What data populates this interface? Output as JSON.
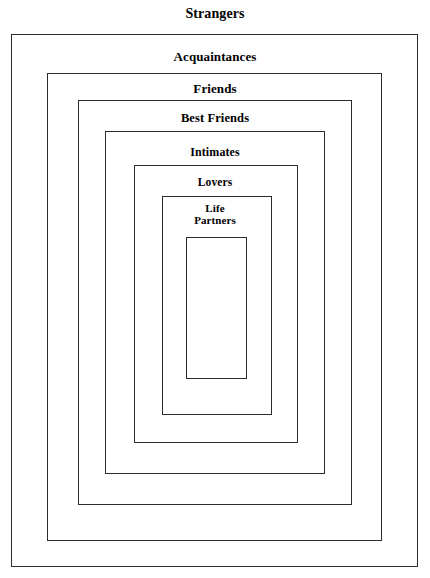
{
  "diagram": {
    "type": "nested-rectangles",
    "title": "Strangers",
    "rings": [
      {
        "label": "Strangers",
        "level": 1,
        "label_position": "above-outside",
        "geometry": {
          "left": 11,
          "top": 34,
          "right": 418,
          "bottom": 567
        },
        "label_top": 6,
        "font_size": 14
      },
      {
        "label": "Acquaintances",
        "level": 2,
        "label_position": "inside-top",
        "geometry": {
          "left": 47,
          "top": 73,
          "right": 382,
          "bottom": 541
        },
        "label_top": 50,
        "font_size": 13
      },
      {
        "label": "Friends",
        "level": 3,
        "label_position": "inside-top",
        "geometry": {
          "left": 78,
          "top": 100,
          "right": 352,
          "bottom": 505
        },
        "label_top": 82,
        "font_size": 13
      },
      {
        "label": "Best Friends",
        "level": 4,
        "label_position": "inside-top",
        "geometry": {
          "left": 105,
          "top": 131,
          "right": 325,
          "bottom": 474
        },
        "label_top": 112,
        "font_size": 12.5
      },
      {
        "label": "Intimates",
        "level": 5,
        "label_position": "inside-top",
        "geometry": {
          "left": 134,
          "top": 165,
          "right": 298,
          "bottom": 443
        },
        "label_top": 146,
        "font_size": 12
      },
      {
        "label": "Lovers",
        "level": 6,
        "label_position": "inside-top",
        "geometry": {
          "left": 162,
          "top": 196,
          "right": 272,
          "bottom": 415
        },
        "label_top": 176,
        "font_size": 11.5
      },
      {
        "label": "Life\nPartners",
        "level": 7,
        "label_position": "inside-top",
        "geometry": {
          "left": 186,
          "top": 237,
          "right": 247,
          "bottom": 379
        },
        "label_top": 203,
        "font_size": 11
      }
    ],
    "colors": {
      "stroke": "#2b2b2b",
      "text": "#000000",
      "background": "#ffffff"
    }
  }
}
